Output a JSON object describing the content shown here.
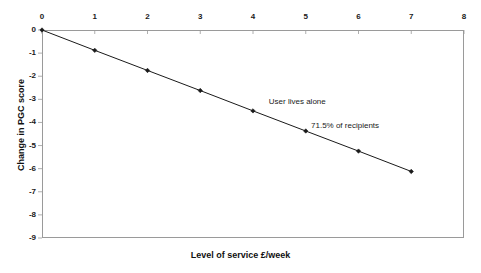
{
  "chart_data": {
    "type": "line",
    "title": "",
    "subtitle": "",
    "xlabel": "Level of service £/week",
    "ylabel": "Change in PGC score",
    "x": [
      0,
      1,
      2,
      3,
      4,
      5,
      6,
      7
    ],
    "values": [
      0,
      -0.88,
      -1.75,
      -2.62,
      -3.5,
      -4.37,
      -5.24,
      -6.12
    ],
    "series": [
      {
        "name": "User lives alone",
        "values": [
          0,
          -0.88,
          -1.75,
          -2.62,
          -3.5,
          -4.37,
          -5.24,
          -6.12
        ]
      }
    ],
    "xlim": [
      0,
      8
    ],
    "ylim": [
      -9,
      0
    ],
    "xticks": [
      "0",
      "1",
      "2",
      "3",
      "4",
      "5",
      "6",
      "7",
      "8"
    ],
    "yticks": [
      "0",
      "-1",
      "-2",
      "-3",
      "-4",
      "-5",
      "-6",
      "-7",
      "-8",
      "-9"
    ],
    "xtick_values": [
      0,
      1,
      2,
      3,
      4,
      5,
      6,
      7,
      8
    ],
    "ytick_values": [
      0,
      -1,
      -2,
      -3,
      -4,
      -5,
      -6,
      -7,
      -8,
      -9
    ],
    "x_axis_position": "top",
    "grid": false,
    "legend": "none",
    "annotations": [
      {
        "id": "series-label",
        "text": "User lives alone",
        "x": 4.3,
        "y": -3.1
      },
      {
        "id": "share-label",
        "text": "71.5% of recipients",
        "x": 5.1,
        "y": -4.15
      }
    ],
    "marker": "diamond",
    "line_color": "#1a1a1a",
    "marker_color": "#1a1a1a",
    "axis_color": "#9a9a9a",
    "background": "#ffffff"
  },
  "axis": {
    "x_title": "Level of service £/week",
    "y_title": "Change in PGC score"
  },
  "annotations": {
    "series_label": "User lives alone",
    "share_label": "71.5% of recipients"
  }
}
